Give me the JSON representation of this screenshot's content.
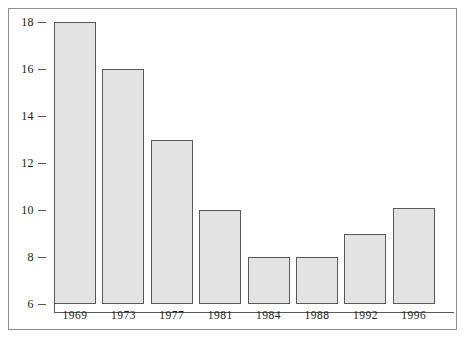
{
  "chart_data": {
    "type": "bar",
    "title": "",
    "subtitle": "",
    "xlabel": "",
    "ylabel": "",
    "categories": [
      "1969",
      "1973",
      "1977",
      "1981",
      "1984",
      "1988",
      "1992",
      "1996"
    ],
    "values": [
      18,
      16,
      13,
      10,
      8,
      8,
      9,
      10.1
    ],
    "ylim": [
      6,
      18
    ],
    "yticks": [
      6,
      8,
      10,
      12,
      14,
      16,
      18
    ],
    "ytick_labels": [
      "6",
      "8",
      "10",
      "12",
      "14",
      "16",
      "18"
    ],
    "grid": false,
    "legend": null,
    "series": [
      {
        "name": "",
        "values": [
          18,
          16,
          13,
          10,
          8,
          8,
          9,
          10.1
        ]
      }
    ],
    "colors": {
      "bar_fill": "#e3e3e3",
      "bar_border": "#585858",
      "axis": "#595959",
      "frame": "#8e8e8e",
      "text": "#1c1c1c",
      "background": "#ffffff"
    }
  }
}
